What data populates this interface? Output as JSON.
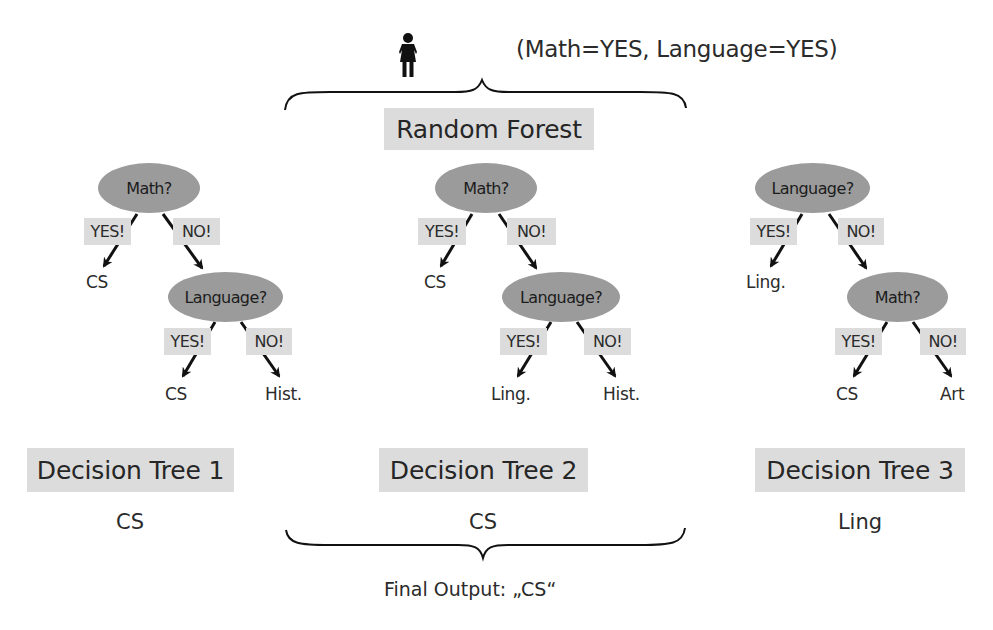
{
  "query": {
    "icon": "person-female-icon",
    "text": "(Math=YES, Language=YES)"
  },
  "forest": {
    "title": "Random Forest"
  },
  "trees": [
    {
      "title": "Decision Tree 1",
      "result": "CS",
      "root": "Math?",
      "root_yes_label": "YES!",
      "root_no_label": "NO!",
      "root_yes_leaf": "CS",
      "child": "Language?",
      "child_yes_label": "YES!",
      "child_no_label": "NO!",
      "child_yes_leaf": "CS",
      "child_no_leaf": "Hist."
    },
    {
      "title": "Decision Tree 2",
      "result": "CS",
      "root": "Math?",
      "root_yes_label": "YES!",
      "root_no_label": "NO!",
      "root_yes_leaf": "CS",
      "child": "Language?",
      "child_yes_label": "YES!",
      "child_no_label": "NO!",
      "child_yes_leaf": "Ling.",
      "child_no_leaf": "Hist."
    },
    {
      "title": "Decision Tree 3",
      "result": "Ling",
      "root": "Language?",
      "root_yes_label": "YES!",
      "root_no_label": "NO!",
      "root_yes_leaf": "Ling.",
      "child": "Math?",
      "child_yes_label": "YES!",
      "child_no_label": "NO!",
      "child_yes_leaf": "CS",
      "child_no_leaf": "Art"
    }
  ],
  "final_output": "Final Output: „CS“",
  "colors": {
    "node_fill": "#9b9b9b",
    "label_fill": "#dcdcdc",
    "text": "#2b2b2b",
    "line": "#111111"
  }
}
